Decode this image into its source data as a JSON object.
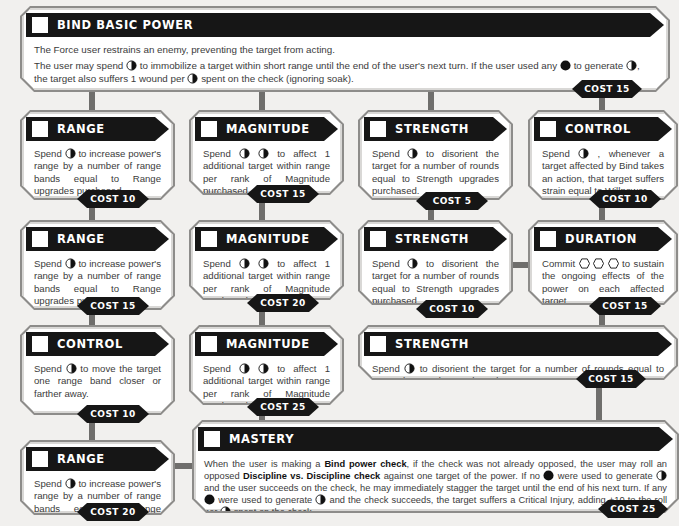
{
  "tree": {
    "colors": {
      "header": "#161616",
      "frame": "#8d8c8a",
      "connector": "#6f6e6c",
      "background": "#f1f0ee",
      "card": "#ffffff"
    },
    "basic": {
      "title": "BIND BASIC POWER",
      "line1": "The Force user restrains an enemy, preventing the target from acting.",
      "line2a": "The user may spend",
      "line2b": "to immobilize a target within short range until the end of the user's next turn. If the user used any",
      "line2c": "to generate",
      "line2d": ", the target also suffers 1 wound per",
      "line2e": "spent on the check (ignoring soak).",
      "cost": "COST 15"
    },
    "cards": [
      {
        "id": "range-1",
        "title": "RANGE",
        "pre": "Spend",
        "post": "to increase power's range by a number of range bands equal to Range upgrades purchased.",
        "cost": "COST 10"
      },
      {
        "id": "magnitude-1",
        "title": "MAGNITUDE",
        "pre": "Spend",
        "post": "to affect 1 additional target within range per rank of Magnitude purchased.",
        "cost": "COST 15"
      },
      {
        "id": "strength-1",
        "title": "STRENGTH",
        "pre": "Spend",
        "post": "to disorient the target for a number of rounds equal to Strength upgrades purchased.",
        "cost": "COST 5"
      },
      {
        "id": "control-1",
        "title": "CONTROL",
        "pre": "Spend",
        "post": ", whenever a target affected by Bind takes an action, that target suffers strain equal to Willpower.",
        "cost": "COST 10"
      },
      {
        "id": "range-2",
        "title": "RANGE",
        "pre": "Spend",
        "post": "to increase power's range by a number of range bands equal to Range upgrades purchased.",
        "cost": "COST 15"
      },
      {
        "id": "magnitude-2",
        "title": "MAGNITUDE",
        "pre": "Spend",
        "post": "to affect 1 additional target within range per rank of Magnitude purchased.",
        "cost": "COST 20"
      },
      {
        "id": "strength-2",
        "title": "STRENGTH",
        "pre": "Spend",
        "post": "to disorient the target for a number of rounds equal to Strength upgrades purchased.",
        "cost": "COST 10"
      },
      {
        "id": "duration",
        "title": "DURATION",
        "pre": "Commit",
        "post": "to sustain the ongoing effects of the power on each affected target.",
        "cost": "COST 15"
      },
      {
        "id": "control-2",
        "title": "CONTROL",
        "pre": "Spend",
        "post": "to move the target one range band closer or farther away.",
        "cost": "COST 10"
      },
      {
        "id": "magnitude-3",
        "title": "MAGNITUDE",
        "pre": "Spend",
        "post": "to affect 1 additional target within range per rank of Magnitude purchased.",
        "cost": "COST 25"
      },
      {
        "id": "strength-3",
        "title": "STRENGTH",
        "pre": "Spend",
        "post": "to disorient the target for a number of rounds equal to Strength upgrades purchased.",
        "cost": "COST 15"
      },
      {
        "id": "range-3",
        "title": "RANGE",
        "pre": "Spend",
        "post": "to increase power's range by a number of range bands equal to Range upgrades purchased.",
        "cost": "COST 20"
      }
    ],
    "mastery": {
      "title": "MASTERY",
      "t1": "When the user is making a ",
      "b1": "Bind power check",
      "t2": ", if the check was not already opposed, the user may roll an opposed ",
      "b2": "Discipline vs. Discipline check",
      "t3": " against one target of the power. If no",
      "t4": "were used to generate",
      "t5": "and the user succeeds on the check, he may immediately stagger the target until the end of his next turn. If any",
      "t6": "were used to generate",
      "t7": "and the check succeeds, the target suffers a Critical Injury, adding +10 to the roll per",
      "t8": "spent on the check.",
      "cost": "COST 25"
    },
    "icons": {
      "force_point_half": "light-dark-pip-icon",
      "dark_pip": "dark-pip-icon",
      "force_die_hex": "force-die-icon"
    }
  }
}
